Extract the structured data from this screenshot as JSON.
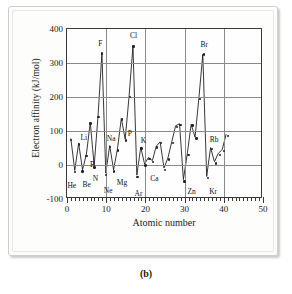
{
  "figure": {
    "caption": "(b)"
  },
  "chart_data": {
    "type": "line",
    "title": "",
    "xlabel": "Atomic number",
    "ylabel": "Electron affinity (kJ/mol)",
    "xlim": [
      0,
      50
    ],
    "ylim": [
      -100,
      400
    ],
    "grid": true,
    "legend": "none",
    "marker": "filled-circle",
    "xticks": [
      0,
      10,
      20,
      30,
      40,
      50
    ],
    "yticks": [
      -100,
      0,
      100,
      200,
      300,
      400
    ],
    "xtick_labels": [
      "0",
      "10",
      "20",
      "30",
      "40",
      "50"
    ],
    "ytick_labels": [
      "-100",
      "0",
      "100",
      "200",
      "300",
      "400"
    ],
    "x": [
      1,
      2,
      3,
      4,
      5,
      6,
      7,
      8,
      9,
      10,
      11,
      12,
      13,
      14,
      15,
      16,
      17,
      18,
      19,
      20,
      21,
      22,
      23,
      24,
      25,
      26,
      27,
      28,
      29,
      30,
      31,
      32,
      33,
      34,
      35,
      36,
      37,
      38,
      39,
      40,
      41
    ],
    "y": [
      73,
      -21,
      60,
      -19,
      27,
      122,
      -7,
      141,
      328,
      -29,
      53,
      -19,
      43,
      134,
      72,
      200,
      349,
      -35,
      48,
      -2,
      18,
      8,
      51,
      64,
      -14,
      16,
      64,
      112,
      118,
      -48,
      29,
      116,
      78,
      195,
      325,
      -39,
      47,
      5,
      30,
      41,
      86
    ],
    "point_labels": [
      {
        "x": 2,
        "y": -21,
        "text": "He",
        "dx": -3,
        "dy": 13
      },
      {
        "x": 3,
        "y": 60,
        "text": "Li",
        "dx": 5,
        "dy": -8
      },
      {
        "x": 4,
        "y": -19,
        "text": "Be",
        "dx": 4,
        "dy": 13
      },
      {
        "x": 5,
        "y": 27,
        "text": "B",
        "dx": 6,
        "dy": 8
      },
      {
        "x": 7,
        "y": -7,
        "text": "N",
        "dx": 1,
        "dy": 11
      },
      {
        "x": 9,
        "y": 328,
        "text": "F",
        "dx": -2,
        "dy": -10
      },
      {
        "x": 10,
        "y": -29,
        "text": "Ne",
        "dx": 2,
        "dy": 15
      },
      {
        "x": 11,
        "y": 53,
        "text": "Na",
        "dx": 1,
        "dy": -9
      },
      {
        "x": 12,
        "y": -19,
        "text": "Mg",
        "dx": 8,
        "dy": 11
      },
      {
        "x": 15,
        "y": 72,
        "text": "P",
        "dx": 4,
        "dy": -8
      },
      {
        "x": 17,
        "y": 349,
        "text": "Cl",
        "dx": 0,
        "dy": -11
      },
      {
        "x": 18,
        "y": -35,
        "text": "Ar",
        "dx": 1,
        "dy": 16
      },
      {
        "x": 19,
        "y": 48,
        "text": "K",
        "dx": 2,
        "dy": -9
      },
      {
        "x": 20,
        "y": -2,
        "text": "Ca",
        "dx": 9,
        "dy": 12
      },
      {
        "x": 30,
        "y": -48,
        "text": "Zn",
        "dx": 7,
        "dy": 10
      },
      {
        "x": 35,
        "y": 325,
        "text": "Br",
        "dx": 0,
        "dy": -11
      },
      {
        "x": 36,
        "y": -39,
        "text": "Kr",
        "dx": 5,
        "dy": 13
      },
      {
        "x": 37,
        "y": 47,
        "text": "Rb",
        "dx": 2,
        "dy": -10
      }
    ]
  }
}
